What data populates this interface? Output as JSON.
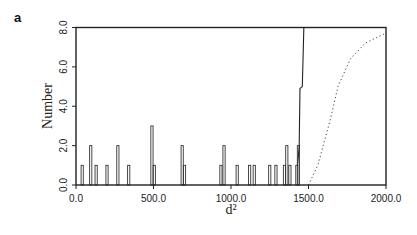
{
  "panel_label": "a",
  "chart_data": {
    "type": "bar",
    "title": "",
    "xlabel": "d²",
    "ylabel": "Number",
    "xlim": [
      0,
      2000
    ],
    "ylim": [
      0,
      8
    ],
    "grid": false,
    "legend": null,
    "x_ticks": [
      "0.0",
      "500.0",
      "1000.0",
      "1500.0",
      "2000.0"
    ],
    "y_ticks": [
      "0.0",
      "2.0",
      "4.0",
      "6.0",
      "8.0"
    ],
    "series": [
      {
        "name": "observed histogram",
        "style": "solid outline bars",
        "bars": [
          {
            "x": 40,
            "value": 1
          },
          {
            "x": 95,
            "value": 2
          },
          {
            "x": 130,
            "value": 1
          },
          {
            "x": 200,
            "value": 1
          },
          {
            "x": 270,
            "value": 2
          },
          {
            "x": 340,
            "value": 1
          },
          {
            "x": 490,
            "value": 3
          },
          {
            "x": 505,
            "value": 1
          },
          {
            "x": 685,
            "value": 2
          },
          {
            "x": 700,
            "value": 1
          },
          {
            "x": 935,
            "value": 1
          },
          {
            "x": 955,
            "value": 2
          },
          {
            "x": 1040,
            "value": 1
          },
          {
            "x": 1120,
            "value": 1
          },
          {
            "x": 1150,
            "value": 1
          },
          {
            "x": 1250,
            "value": 1
          },
          {
            "x": 1290,
            "value": 1
          },
          {
            "x": 1345,
            "value": 1
          },
          {
            "x": 1360,
            "value": 2
          },
          {
            "x": 1380,
            "value": 1
          },
          {
            "x": 1425,
            "value": 1
          },
          {
            "x": 1435,
            "value": 2
          }
        ]
      },
      {
        "name": "observed cumulative rise",
        "style": "solid line",
        "points": [
          [
            1430,
            1
          ],
          [
            1440,
            2
          ],
          [
            1445,
            4.9
          ],
          [
            1460,
            5
          ],
          [
            1470,
            8.2
          ]
        ]
      },
      {
        "name": "expected distribution",
        "style": "dotted line",
        "points": [
          [
            1500,
            0
          ],
          [
            1560,
            1
          ],
          [
            1640,
            3.3
          ],
          [
            1690,
            5
          ],
          [
            1770,
            6.4
          ],
          [
            1865,
            7.2
          ],
          [
            1995,
            7.7
          ]
        ]
      }
    ]
  }
}
